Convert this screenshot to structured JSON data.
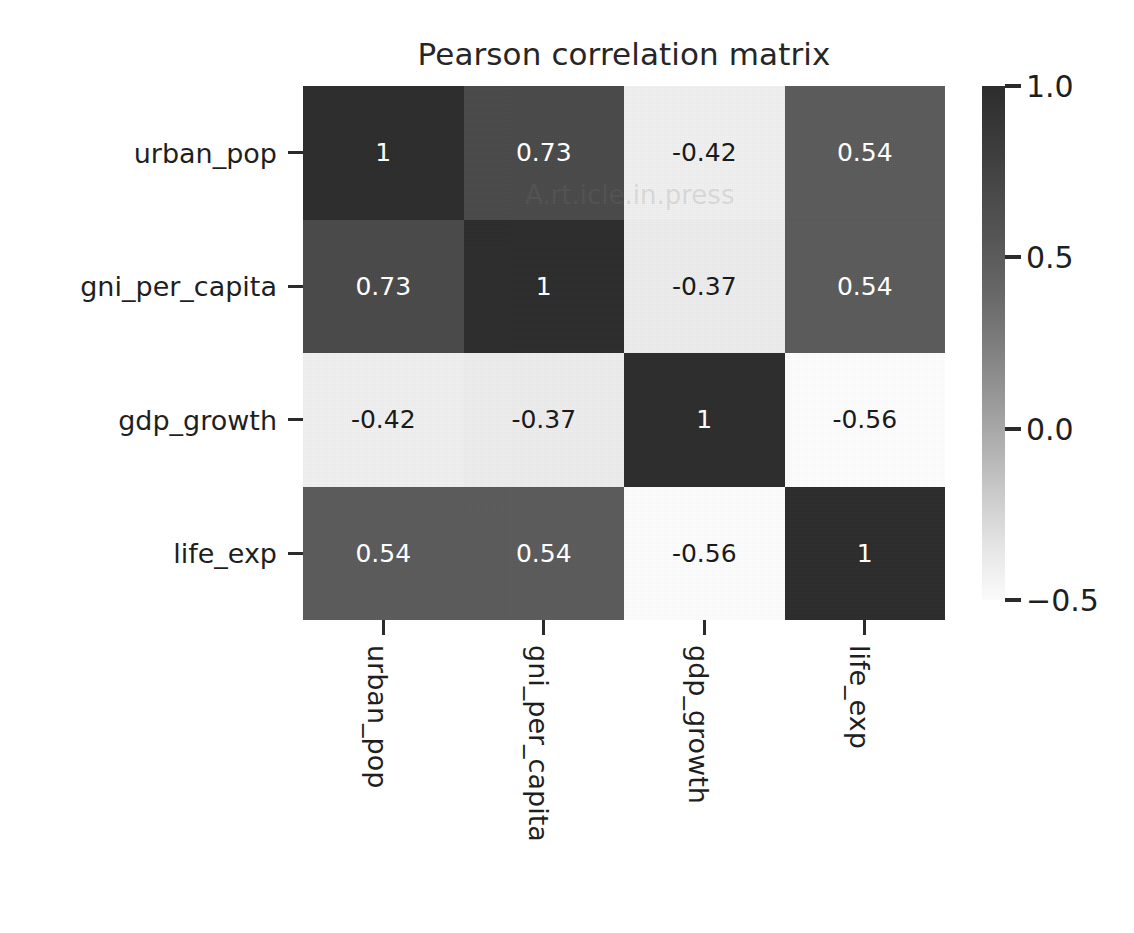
{
  "chart_data": {
    "type": "heatmap",
    "title": "Pearson correlation matrix",
    "xlabel": "",
    "ylabel": "",
    "categories": [
      "urban_pop",
      "gni_per_capita",
      "gdp_growth",
      "life_exp"
    ],
    "x_tick_labels": [
      "urban_pop",
      "gni_per_capita",
      "gdp_growth",
      "life_exp"
    ],
    "y_tick_labels": [
      "urban_pop",
      "gni_per_capita",
      "gdp_growth",
      "life_exp"
    ],
    "matrix": [
      [
        1,
        0.73,
        -0.42,
        0.54
      ],
      [
        0.73,
        1,
        -0.37,
        0.54
      ],
      [
        -0.42,
        -0.37,
        1,
        -0.56
      ],
      [
        0.54,
        0.54,
        -0.56,
        1
      ]
    ],
    "cell_text": [
      [
        "1",
        "0.73",
        "-0.42",
        "0.54"
      ],
      [
        "0.73",
        "1",
        "-0.37",
        "0.54"
      ],
      [
        "-0.42",
        "-0.37",
        "1",
        "-0.56"
      ],
      [
        "0.54",
        "0.54",
        "-0.56",
        "1"
      ]
    ],
    "cell_colors": [
      [
        "#2d2d2d",
        "#4a4a4a",
        "#f0f0f0",
        "#5b5b5b"
      ],
      [
        "#4a4a4a",
        "#2d2d2d",
        "#ededed",
        "#5b5b5b"
      ],
      [
        "#f0f0f0",
        "#ededed",
        "#2d2d2d",
        "#fdfdfd"
      ],
      [
        "#5b5b5b",
        "#5b5b5b",
        "#fdfdfd",
        "#2d2d2d"
      ]
    ],
    "cell_text_colors": [
      [
        "#ffffff",
        "#ffffff",
        "#1a1a1a",
        "#ffffff"
      ],
      [
        "#ffffff",
        "#ffffff",
        "#1a1a1a",
        "#ffffff"
      ],
      [
        "#1a1a1a",
        "#1a1a1a",
        "#ffffff",
        "#1a1a1a"
      ],
      [
        "#ffffff",
        "#ffffff",
        "#1a1a1a",
        "#ffffff"
      ]
    ],
    "colormap": "Greys",
    "colorbar": {
      "ticks": [
        "1.0",
        "0.5",
        "0.0",
        "−0.5"
      ],
      "tick_values": [
        1.0,
        0.5,
        0.0,
        -0.5
      ],
      "vmin": -0.5,
      "vmax": 1.0,
      "high_color": "#2d2d2d",
      "low_color": "#fbfbfb"
    },
    "grid": false,
    "legend_position": "right"
  },
  "watermark": {
    "text": "A.rt.icle.in.press"
  }
}
